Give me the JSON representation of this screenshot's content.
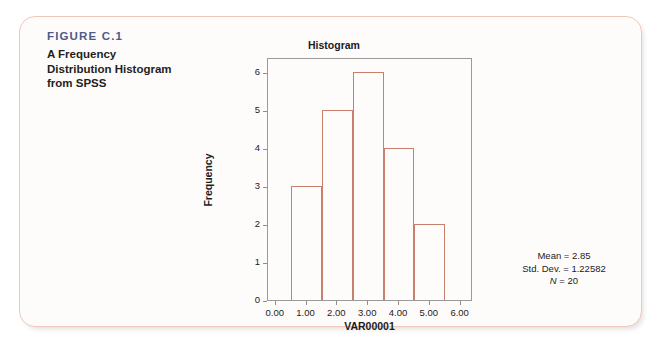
{
  "figure": {
    "number": "FIGURE C.1",
    "caption": "A Frequency Distribution Histogram from SPSS",
    "number_color": "#4d5a8c",
    "card_border_color": "#f0c8ba"
  },
  "chart_data": {
    "type": "bar",
    "title": "Histogram",
    "xlabel": "VAR00001",
    "ylabel": "Frequency",
    "bar_edge_color": "#c8806c",
    "bar_fill": "none",
    "grid": false,
    "legend": "none",
    "xlim": [
      -0.25,
      6.4
    ],
    "ylim": [
      0,
      6.4
    ],
    "xticks": [
      "0.00",
      "1.00",
      "2.00",
      "3.00",
      "4.00",
      "5.00",
      "6.00"
    ],
    "xtick_values": [
      0,
      1,
      2,
      3,
      4,
      5,
      6
    ],
    "yticks": [
      "0",
      "1",
      "2",
      "3",
      "4",
      "5",
      "6"
    ],
    "ytick_values": [
      0,
      1,
      2,
      3,
      4,
      5,
      6
    ],
    "bin_edges": [
      0.5,
      1.5,
      2.5,
      3.5,
      4.5,
      5.5
    ],
    "bin_centers": [
      1,
      2,
      3,
      4,
      5
    ],
    "values": [
      3,
      5,
      6,
      4,
      2
    ],
    "annotations": {
      "mean": "Mean = 2.85",
      "std_dev": "Std. Dev. = 1.22582",
      "n_label": "N",
      "n_text": " = 20"
    }
  }
}
